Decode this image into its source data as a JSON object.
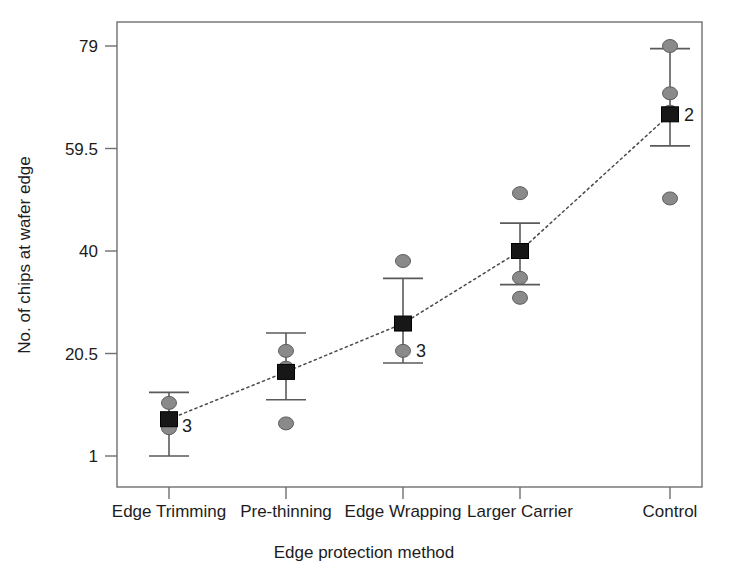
{
  "chart_data": {
    "type": "scatter",
    "title": "",
    "xlabel": "Edge protection method",
    "ylabel": "No. of chips at wafer edge",
    "categories": [
      "Edge Trimming",
      "Pre-thinning",
      "Edge Wrapping",
      "Larger Carrier",
      "Control"
    ],
    "ytick_labels": [
      "1",
      "20.5",
      "40",
      "59.5",
      "79"
    ],
    "ytick_values": [
      1,
      20.5,
      40,
      59.5,
      79
    ],
    "ylim": [
      -1.5,
      87
    ],
    "grid": false,
    "legend": false,
    "series": [
      {
        "name": "Mean",
        "marker": "filled-square",
        "values": [
          8.0,
          17.0,
          26.2,
          40.0,
          66.0
        ]
      },
      {
        "name": "95% CI",
        "marker": "error-bar",
        "lower": [
          1.0,
          11.7,
          18.7,
          33.6,
          60.0
        ],
        "upper": [
          13.1,
          24.4,
          34.8,
          45.3,
          78.5
        ]
      }
    ],
    "observations": [
      {
        "category": "Edge Trimming",
        "values": [
          11.1,
          6.3
        ]
      },
      {
        "category": "Pre-thinning",
        "values": [
          21.0,
          17.8,
          7.2
        ]
      },
      {
        "category": "Edge Wrapping",
        "values": [
          38.1,
          21.0
        ]
      },
      {
        "category": "Larger Carrier",
        "values": [
          51.0,
          40.1,
          34.9,
          31.1
        ]
      },
      {
        "category": "Control",
        "values": [
          79.0,
          70.0,
          66.5,
          50.0
        ]
      }
    ],
    "point_count_labels": [
      {
        "category": "Edge Trimming",
        "label": "3"
      },
      {
        "category": "Edge Wrapping",
        "label": "3"
      },
      {
        "category": "Control",
        "label": "2"
      }
    ],
    "trend_line": {
      "style": "dotted",
      "connects": "means",
      "values": [
        8.0,
        17.0,
        26.2,
        40.0,
        66.0
      ]
    },
    "colors": {
      "point_fill": "#8a8a8a",
      "point_stroke": "#5d5d5d",
      "mean_fill": "#171717",
      "errorbar": "#5a5a5a",
      "frame": "#6f6f6f",
      "trend": "#4a4a4a",
      "text": "#1c1c1c",
      "background": "#ffffff"
    }
  },
  "axes": {
    "y_title": "No. of chips at wafer edge",
    "x_title": "Edge protection method",
    "y_ticks": [
      {
        "label": "79"
      },
      {
        "label": "59.5"
      },
      {
        "label": "40"
      },
      {
        "label": "20.5"
      },
      {
        "label": "1"
      }
    ],
    "x_ticks": [
      {
        "label": "Edge Trimming"
      },
      {
        "label": "Pre-thinning"
      },
      {
        "label": "Edge Wrapping"
      },
      {
        "label": "Larger Carrier"
      },
      {
        "label": "Control"
      }
    ]
  },
  "annotations": [
    {
      "label": "3"
    },
    {
      "label": "3"
    },
    {
      "label": "2"
    }
  ]
}
